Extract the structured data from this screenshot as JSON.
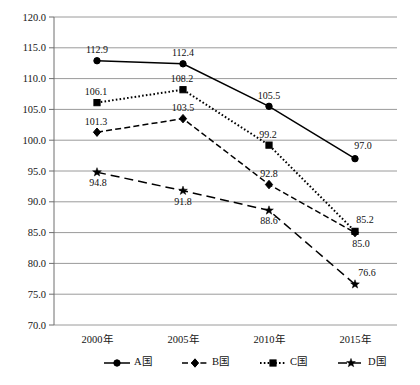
{
  "chart_data": {
    "type": "line",
    "title": "",
    "subtitle": "",
    "xlabel": "",
    "ylabel": "",
    "categories": [
      "2000年",
      "2005年",
      "2010年",
      "2015年"
    ],
    "ylim": [
      70.0,
      120.0
    ],
    "ytick_step": 5.0,
    "ytick_labels": [
      "120.0",
      "115.0",
      "110.0",
      "105.0",
      "100.0",
      "95.0",
      "90.0",
      "85.0",
      "80.0",
      "75.0",
      "70.0"
    ],
    "ytick_values": [
      120.0,
      115.0,
      110.0,
      105.0,
      100.0,
      95.0,
      90.0,
      85.0,
      80.0,
      75.0,
      70.0
    ],
    "grid": "horizontal",
    "legend_position": "bottom",
    "series": [
      {
        "name": "A国",
        "marker": "circle",
        "linestyle": "solid",
        "color": "#000000",
        "values": [
          112.9,
          112.4,
          105.5,
          97.0
        ],
        "labels": [
          "112.9",
          "112.4",
          "105.5",
          "97.0"
        ],
        "label_positions": [
          "above",
          "above",
          "above",
          "above"
        ]
      },
      {
        "name": "B国",
        "marker": "diamond",
        "linestyle": "dashed",
        "color": "#000000",
        "values": [
          101.3,
          103.5,
          92.8,
          85.0
        ],
        "labels": [
          "101.3",
          "103.5",
          "92.8",
          "85.0"
        ],
        "label_positions": [
          "above",
          "above",
          "above",
          "below"
        ]
      },
      {
        "name": "C国",
        "marker": "square",
        "linestyle": "dotted",
        "color": "#000000",
        "values": [
          106.1,
          108.2,
          99.2,
          85.2
        ],
        "labels": [
          "106.1",
          "108.2",
          "99.2",
          "85.2"
        ],
        "label_positions": [
          "above",
          "above",
          "above",
          "above"
        ]
      },
      {
        "name": "D国",
        "marker": "star",
        "linestyle": "longdash",
        "color": "#000000",
        "values": [
          94.8,
          91.8,
          88.6,
          76.6
        ],
        "labels": [
          "94.8",
          "91.8",
          "88.6",
          "76.6"
        ],
        "label_positions": [
          "below",
          "below",
          "below",
          "above"
        ]
      }
    ]
  },
  "legend": {
    "items": [
      {
        "label": "A国",
        "marker": "circle",
        "linestyle": "solid"
      },
      {
        "label": "B国",
        "marker": "diamond",
        "linestyle": "dashed"
      },
      {
        "label": "C国",
        "marker": "square",
        "linestyle": "dotted"
      },
      {
        "label": "D国",
        "marker": "star",
        "linestyle": "longdash"
      }
    ]
  }
}
